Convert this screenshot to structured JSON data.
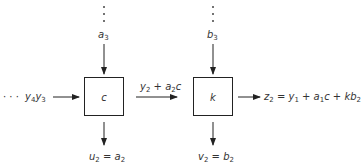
{
  "diagram": {
    "type": "block-diagram",
    "blocks": [
      {
        "id": "c",
        "label": "c"
      },
      {
        "id": "k",
        "label": "k"
      }
    ],
    "inputs": {
      "left_stream_dots": "· · ·",
      "left_stream_label": "y4y3",
      "c_top_label": "a3",
      "k_top_label": "b3"
    },
    "middle_label": "y2 + a2c",
    "outputs": {
      "c_bottom_label": "u2 = a2",
      "k_bottom_label": "v2 = b2",
      "right_label": "z2 = y1 + a1c + kb2"
    }
  }
}
